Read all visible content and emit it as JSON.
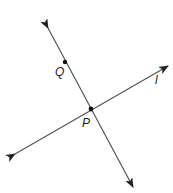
{
  "diagram": {
    "type": "geometry-lines",
    "colors": {
      "line": "#555555",
      "point": "#111111",
      "label": "#222222",
      "background": "#ffffff"
    },
    "lines": [
      {
        "id": "line-QP",
        "description": "line through Q and P",
        "from": [
          48,
          28
        ],
        "to": [
          133,
          187
        ],
        "arrows": "both"
      },
      {
        "id": "line-l",
        "label": "l",
        "from": [
          15,
          154
        ],
        "to": [
          168,
          66
        ],
        "arrows": "both"
      }
    ],
    "points": [
      {
        "id": "Q",
        "label": "Q",
        "x": 65,
        "y": 62,
        "label_x": 55,
        "label_y": 76
      },
      {
        "id": "P",
        "label": "P",
        "x": 91,
        "y": 109,
        "label_x": 82,
        "label_y": 127
      }
    ],
    "line_labels": [
      {
        "for": "line-l",
        "text": "l",
        "x": 155,
        "y": 84
      }
    ]
  }
}
